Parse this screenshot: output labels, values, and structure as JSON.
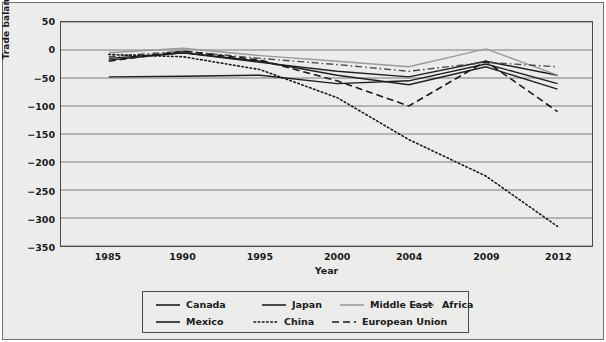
{
  "chart_data": {
    "type": "line",
    "title": "",
    "xlabel": "Year",
    "ylabel": "Trade balance ($ billions)",
    "categories": [
      "1985",
      "1990",
      "1995",
      "2000",
      "2004",
      "2009",
      "2012"
    ],
    "x_positions_pct": [
      9.0,
      23.0,
      37.5,
      52.0,
      65.5,
      80.0,
      93.5
    ],
    "ylim": [
      -350,
      50
    ],
    "yticks": [
      50,
      0,
      -50,
      -100,
      -150,
      -200,
      -250,
      -300,
      -350
    ],
    "ytick_labels": [
      "50",
      "0",
      "−50",
      "−100",
      "−150",
      "−200",
      "−250",
      "−300",
      "−350"
    ],
    "grid": "horizontal",
    "legend_position": "below-plot",
    "series": [
      {
        "name": "Canada",
        "style": "solid",
        "color": "#1f1f1f",
        "width": 1.4,
        "values": [
          -48,
          -47,
          -45,
          -60,
          -55,
          -25,
          -60
        ]
      },
      {
        "name": "Japan",
        "style": "solid",
        "color": "#1f1f1f",
        "width": 1.4,
        "values": [
          -18,
          -5,
          -22,
          -38,
          -48,
          -20,
          -45
        ]
      },
      {
        "name": "Middle East",
        "style": "solid",
        "color": "#9a9a9a",
        "width": 1.4,
        "values": [
          -5,
          3,
          -10,
          -20,
          -30,
          2,
          -45
        ]
      },
      {
        "name": "Africa",
        "style": "dashdot",
        "color": "#4a4a4a",
        "width": 1.4,
        "values": [
          -12,
          -2,
          -15,
          -26,
          -38,
          -22,
          -30
        ]
      },
      {
        "name": "Mexico",
        "style": "solid",
        "color": "#1f1f1f",
        "width": 1.4,
        "values": [
          -15,
          -5,
          -20,
          -45,
          -62,
          -30,
          -70
        ]
      },
      {
        "name": "China",
        "style": "dotted",
        "color": "#1a1a1a",
        "width": 1.6,
        "values": [
          -8,
          -12,
          -35,
          -85,
          -160,
          -225,
          -315
        ]
      },
      {
        "name": "European Union",
        "style": "dashed",
        "color": "#1a1a1a",
        "width": 1.6,
        "values": [
          -20,
          -2,
          -18,
          -55,
          -100,
          -20,
          -110
        ]
      }
    ],
    "legend_entries": [
      {
        "label": "Canada",
        "style": "solid",
        "color": "#1f1f1f",
        "row": 0,
        "col": 0
      },
      {
        "label": "Japan",
        "style": "solid",
        "color": "#1f1f1f",
        "row": 0,
        "col": 1
      },
      {
        "label": "Middle East",
        "style": "solid",
        "color": "#9a9a9a",
        "row": 0,
        "col": 2
      },
      {
        "label": "Africa",
        "style": "dashdot",
        "color": "#4a4a4a",
        "row": 0,
        "col": 3
      },
      {
        "label": "Mexico",
        "style": "solid",
        "color": "#1f1f1f",
        "row": 1,
        "col": 0
      },
      {
        "label": "China",
        "style": "dotted",
        "color": "#1a1a1a",
        "row": 1,
        "col": 1
      },
      {
        "label": "European Union",
        "style": "dashed",
        "color": "#1a1a1a",
        "row": 1,
        "col": 2
      }
    ]
  },
  "style": {
    "panel_background": "#ececeb",
    "figure_background": "#ececeb",
    "grid_color": "#6f6f6f",
    "axis_color": "#4a4a4a",
    "text_color": "#1a1a1a"
  }
}
